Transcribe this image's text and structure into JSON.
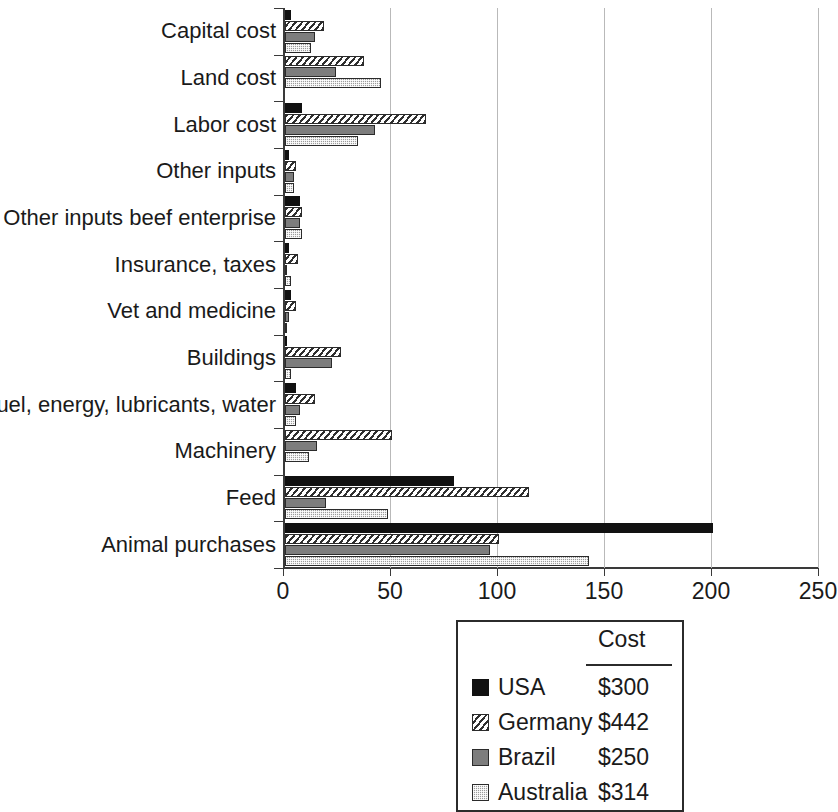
{
  "chart_data": {
    "type": "bar",
    "orientation": "horizontal",
    "title": "",
    "xlabel": "",
    "ylabel": "",
    "xlim": [
      0,
      250
    ],
    "xticks": [
      0,
      50,
      100,
      150,
      200,
      250
    ],
    "grid": true,
    "legend_position": "bottom-center",
    "categories": [
      "Capital cost",
      "Land cost",
      "Labor cost",
      "Other inputs",
      "Other inputs beef enterprise",
      "Insurance, taxes",
      "Vet and medicine",
      "Buildings",
      "Fuel, energy, lubricants, water",
      "Machinery",
      "Feed",
      "Animal purchases"
    ],
    "series": [
      {
        "name": "USA",
        "color": "#111111",
        "pattern": "solid-black",
        "values": [
          3,
          0,
          8,
          2,
          7,
          2,
          3,
          1,
          5,
          0,
          79,
          200
        ]
      },
      {
        "name": "Germany",
        "color": "#2f2f2f",
        "pattern": "diagonal-hatch",
        "values": [
          18,
          37,
          66,
          5,
          8,
          6,
          5,
          26,
          14,
          50,
          114,
          100
        ]
      },
      {
        "name": "Brazil",
        "color": "#7d7d7d",
        "pattern": "solid-gray",
        "values": [
          14,
          24,
          42,
          4,
          7,
          1,
          2,
          22,
          7,
          15,
          19,
          96
        ]
      },
      {
        "name": "Australia",
        "color": "#9c9c9c",
        "pattern": "dotted-grid",
        "values": [
          12,
          45,
          34,
          4,
          8,
          3,
          1,
          3,
          5,
          11,
          48,
          142
        ]
      }
    ]
  },
  "legend": {
    "header_cost": "Cost",
    "rows": [
      {
        "name": "USA",
        "cost": "$300"
      },
      {
        "name": "Germany",
        "cost": "$442"
      },
      {
        "name": "Brazil",
        "cost": "$250"
      },
      {
        "name": "Australia",
        "cost": "$314"
      }
    ]
  }
}
